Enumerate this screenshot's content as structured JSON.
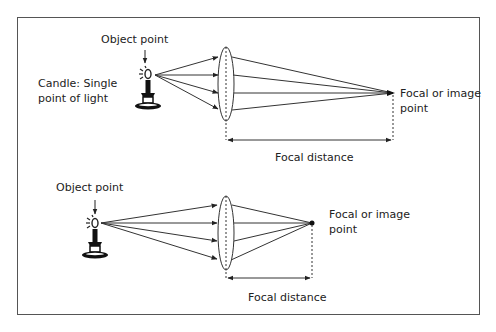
{
  "colors": {
    "line": "#333333",
    "frame": "#555555",
    "text": "#222222",
    "background": "#ffffff"
  },
  "top_diagram": {
    "object_label": "Object point",
    "candle_label_line1": "Candle: Single",
    "candle_label_line2": "point of light",
    "focal_label_line1": "Focal or image",
    "focal_label_line2": "point",
    "distance_label": "Focal distance"
  },
  "bottom_diagram": {
    "object_label": "Object point",
    "focal_label_line1": "Focal or image",
    "focal_label_line2": "point",
    "distance_label": "Focal distance"
  }
}
